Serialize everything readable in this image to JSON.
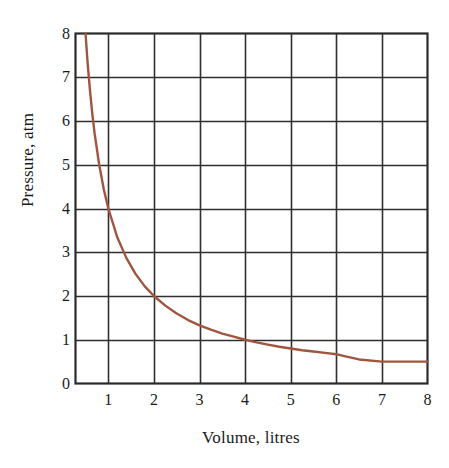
{
  "chart_data": {
    "type": "line",
    "title": "",
    "xlabel": "Volume, litres",
    "ylabel": "Pressure, atm",
    "xlim": [
      0.28,
      8
    ],
    "ylim": [
      0,
      8
    ],
    "grid": true,
    "legend": "none",
    "line_color": "#a0553f",
    "axis_color": "#2a2a2a",
    "grid_color": "#2f2f2f",
    "relationship": "P * V = 4 (Boyle's law isotherm), flattening to P = 0.5 for V > 6.2",
    "xticks": [
      "1",
      "2",
      "3",
      "4",
      "5",
      "6",
      "7",
      "8"
    ],
    "xtick_values": [
      1,
      2,
      3,
      4,
      5,
      6,
      7,
      8
    ],
    "yticks": [
      "0",
      "1",
      "2",
      "3",
      "4",
      "5",
      "6",
      "7",
      "8"
    ],
    "ytick_values": [
      0,
      1,
      2,
      3,
      4,
      5,
      6,
      7,
      8
    ],
    "series": [
      {
        "name": "Pressure vs Volume",
        "x": [
          0.5,
          0.55,
          0.6,
          0.65,
          0.7,
          0.8,
          0.9,
          1.0,
          1.2,
          1.4,
          1.6,
          1.8,
          2.0,
          2.25,
          2.5,
          2.75,
          3.0,
          3.25,
          3.5,
          3.75,
          4.0,
          4.25,
          4.5,
          4.75,
          5.0,
          5.25,
          5.5,
          5.75,
          6.0,
          6.2,
          6.5,
          7.0,
          7.5,
          8.0
        ],
        "y": [
          8.0,
          7.27,
          6.67,
          6.15,
          5.71,
          5.0,
          4.44,
          4.0,
          3.33,
          2.86,
          2.5,
          2.22,
          2.0,
          1.78,
          1.6,
          1.45,
          1.33,
          1.23,
          1.14,
          1.07,
          1.0,
          0.94,
          0.89,
          0.84,
          0.8,
          0.76,
          0.73,
          0.7,
          0.67,
          0.62,
          0.55,
          0.5,
          0.5,
          0.5
        ]
      }
    ]
  },
  "axes": {
    "x_title": "Volume, litres",
    "y_title": "Pressure, atm"
  }
}
